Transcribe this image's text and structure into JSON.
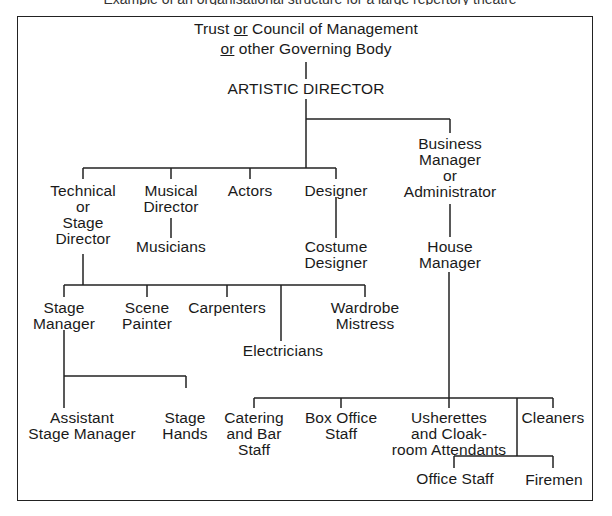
{
  "header_crop_text": "Example of an organisational structure for a large repertory theatre",
  "chart": {
    "root": {
      "line1_pre": "Trust ",
      "line1_or": "or",
      "line1_post": " Council of Management",
      "line2_or": "or",
      "line2_post": " other Governing Body"
    },
    "artistic_director": "ARTISTIC DIRECTOR",
    "nodes": {
      "technical_director": [
        "Technical",
        "or",
        "Stage",
        "Director"
      ],
      "musical_director": [
        "Musical",
        "Director"
      ],
      "musicians": [
        "Musicians"
      ],
      "actors": [
        "Actors"
      ],
      "designer": [
        "Designer"
      ],
      "costume_designer": [
        "Costume",
        "Designer"
      ],
      "business_manager": [
        "Business",
        "Manager",
        "or",
        "Administrator"
      ],
      "house_manager": [
        "House",
        "Manager"
      ],
      "stage_manager": [
        "Stage",
        "Manager"
      ],
      "scene_painter": [
        "Scene",
        "Painter"
      ],
      "carpenters": [
        "Carpenters"
      ],
      "electricians": [
        "Electricians"
      ],
      "wardrobe_mistress": [
        "Wardrobe",
        "Mistress"
      ],
      "assistant_stage_manager": [
        "Assistant",
        "Stage Manager"
      ],
      "stage_hands": [
        "Stage",
        "Hands"
      ],
      "catering_bar_staff": [
        "Catering",
        "and Bar",
        "Staff"
      ],
      "box_office_staff": [
        "Box Office",
        "Staff"
      ],
      "usherettes": [
        "Usherettes",
        "and Cloak-",
        "room Attendants"
      ],
      "cleaners": [
        "Cleaners"
      ],
      "office_staff": [
        "Office Staff"
      ],
      "firemen": [
        "Firemen"
      ]
    },
    "hierarchy": {
      "Trust or Council of Management or other Governing Body": [
        "ARTISTIC DIRECTOR"
      ],
      "ARTISTIC DIRECTOR": [
        "Technical or Stage Director",
        "Musical Director",
        "Actors",
        "Designer",
        "Business Manager or Administrator"
      ],
      "Musical Director": [
        "Musicians"
      ],
      "Designer": [
        "Costume Designer"
      ],
      "Technical or Stage Director": [
        "Stage Manager",
        "Scene Painter",
        "Carpenters",
        "Electricians",
        "Wardrobe Mistress"
      ],
      "Stage Manager": [
        "Assistant Stage Manager",
        "Stage Hands"
      ],
      "Business Manager or Administrator": [
        "House Manager"
      ],
      "House Manager": [
        "Catering and Bar Staff",
        "Box Office Staff",
        "Usherettes and Cloakroom Attendants",
        "Cleaners",
        "Office Staff",
        "Firemen"
      ]
    },
    "line_color": "#222222",
    "text_color": "#1a1a1a"
  }
}
